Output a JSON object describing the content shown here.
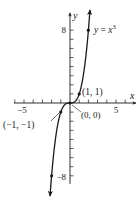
{
  "chart_data": {
    "type": "line",
    "title": "",
    "function": "y = x^3",
    "curve_label": {
      "lhs": "y",
      "eq": " = ",
      "base": "x",
      "exp": "3"
    },
    "xlabel": "x",
    "ylabel": "y",
    "xlim": [
      -6,
      7
    ],
    "ylim": [
      -9,
      9.5
    ],
    "x_tick_step": 1,
    "y_tick_step": 1,
    "x_tick_labels": [
      {
        "value": -5,
        "text": "−5"
      },
      {
        "value": 5,
        "text": "5"
      }
    ],
    "y_tick_labels": [
      {
        "value": 8,
        "text": "8"
      },
      {
        "value": -8,
        "text": "−8"
      }
    ],
    "grid": false,
    "legend": null,
    "series": [
      {
        "name": "y = x^3",
        "x": [
          -2,
          -1.5,
          -1,
          -0.5,
          0,
          0.5,
          1,
          1.5,
          2
        ],
        "y": [
          -8,
          -3.375,
          -1,
          -0.125,
          0,
          0.125,
          1,
          3.375,
          8
        ],
        "arrows_at_ends": true
      }
    ],
    "marked_points": [
      {
        "x": 1,
        "y": 1,
        "label": "(1, 1)"
      },
      {
        "x": 0,
        "y": 0,
        "label": "(0, 0)"
      },
      {
        "x": -1,
        "y": -1,
        "label": "(−1, −1)"
      },
      {
        "x": 2,
        "y": 8,
        "label": ""
      },
      {
        "x": -2,
        "y": -8,
        "label": ""
      }
    ],
    "colors": {
      "ink": "#1a1a1a",
      "background": "#ffffff"
    }
  }
}
